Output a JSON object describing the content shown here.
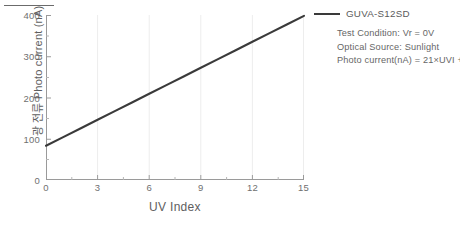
{
  "chart_data": {
    "type": "line",
    "title": "",
    "xlabel": "UV Index",
    "ylabel": "광 전류 Photo current (nA)",
    "xlim": [
      0,
      15
    ],
    "ylim": [
      0,
      400
    ],
    "xticks": [
      "0",
      "3",
      "6",
      "9",
      "12",
      "15"
    ],
    "xtick_values": [
      0,
      3,
      6,
      9,
      12,
      15
    ],
    "yticks": [
      "0",
      "100",
      "200",
      "300",
      "400"
    ],
    "ytick_values": [
      0,
      100,
      200,
      300,
      400
    ],
    "minor_ytick_values": [
      50,
      150,
      250,
      350
    ],
    "grid": false,
    "legend_position": "right",
    "series": [
      {
        "name": "GUVA-S12SD",
        "color": "#3a3a3a",
        "x": [
          0,
          1,
          2,
          3,
          4,
          5,
          6,
          7,
          8,
          9,
          10,
          11,
          12,
          13,
          14,
          15
        ],
        "values": [
          83,
          104,
          125,
          146,
          167,
          188,
          209,
          230,
          251,
          272,
          293,
          314,
          335,
          356,
          377,
          398
        ]
      }
    ],
    "annotations": [
      "Test Condition: Vr = 0V",
      "Optical Source: Sunlight",
      "Photo current(nA) = 21×UVI + 83"
    ],
    "equation": {
      "slope": 21,
      "intercept": 83,
      "text": "Photo current(nA) = 21×UVI + 83"
    }
  },
  "legend": {
    "entry_label": "GUVA-S12SD"
  },
  "axes": {
    "x_title": "UV Index",
    "y_title": "광 전류 Photo current (nA)"
  },
  "colors": {
    "line": "#3a3a3a",
    "axis": "#9a9a9a",
    "tick_text": "#6f6f6f",
    "label_text": "#5e5e5e",
    "annotation_text": "#666666",
    "background": "#ffffff"
  }
}
